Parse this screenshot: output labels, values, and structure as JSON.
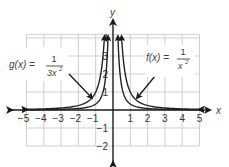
{
  "chart_data": {
    "type": "line",
    "title": "",
    "xlabel": "x",
    "ylabel": "y",
    "xlim": [
      -5,
      5
    ],
    "ylim": [
      -2,
      4
    ],
    "grid": true,
    "x_ticks": [
      -5,
      -4,
      -3,
      -2,
      -1,
      1,
      2,
      3,
      4,
      5
    ],
    "y_ticks": [
      -2,
      -1,
      1,
      2,
      3,
      4
    ],
    "series": [
      {
        "name": "f(x) = 1/x^2",
        "formula": "1/x^2",
        "label_text": "f(x) =",
        "numerator": "1",
        "denominator": "x²",
        "points": [
          [
            -5,
            0.04
          ],
          [
            -4,
            0.0625
          ],
          [
            -3,
            0.111
          ],
          [
            -2,
            0.25
          ],
          [
            -1,
            1
          ],
          [
            -0.5,
            4
          ],
          [
            0.5,
            4
          ],
          [
            1,
            1
          ],
          [
            2,
            0.25
          ],
          [
            3,
            0.111
          ],
          [
            4,
            0.0625
          ],
          [
            5,
            0.04
          ]
        ]
      },
      {
        "name": "g(x) = 1/(3x^2)",
        "formula": "1/(3x^2)",
        "label_text": "g(x) =",
        "numerator": "1",
        "denominator": "3x²",
        "points": [
          [
            -5,
            0.013
          ],
          [
            -4,
            0.021
          ],
          [
            -3,
            0.037
          ],
          [
            -2,
            0.083
          ],
          [
            -1,
            0.333
          ],
          [
            -0.29,
            4
          ],
          [
            0.29,
            4
          ],
          [
            1,
            0.333
          ],
          [
            2,
            0.083
          ],
          [
            3,
            0.037
          ],
          [
            4,
            0.021
          ],
          [
            5,
            0.013
          ]
        ]
      }
    ],
    "annotations": [
      {
        "text": "g(x) = 1/(3x²)",
        "arrow_to": [
          -1,
          0.5
        ],
        "position": "upper-left"
      },
      {
        "text": "f(x) = 1/x²",
        "arrow_to": [
          1.4,
          0.4
        ],
        "position": "upper-right"
      }
    ]
  },
  "axes": {
    "x_label": "x",
    "y_label": "y",
    "x_tick_labels": [
      "−5",
      "−4",
      "−3",
      "−2",
      "−1",
      "1",
      "2",
      "3",
      "4",
      "5"
    ],
    "y_tick_labels": [
      "4",
      "3",
      "2",
      "1",
      "−1",
      "−2"
    ]
  },
  "labels": {
    "g_prefix": "g(x) =",
    "g_num": "1",
    "g_den": "3x",
    "g_exp": "2",
    "f_prefix": "f(x) =",
    "f_num": "1",
    "f_den": "x",
    "f_exp": "2"
  },
  "colors": {
    "grid": "#cccccc",
    "axis": "#1a1a1a",
    "curve": "#222222"
  }
}
